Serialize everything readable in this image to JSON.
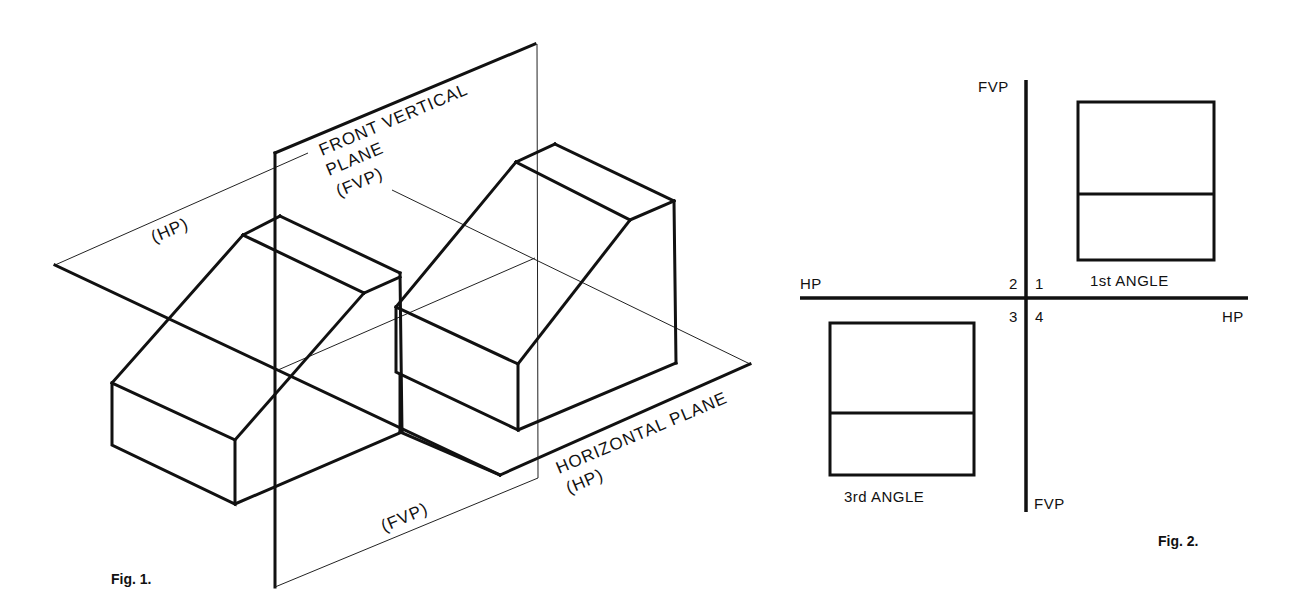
{
  "figure1": {
    "caption": "Fig. 1.",
    "labels": {
      "fvp_line1": "FRONT VERTICAL",
      "fvp_line2": "PLANE",
      "fvp_line3": "(FVP)",
      "hp_upper": "(HP)",
      "fvp_lower": "(FVP)",
      "hp_line1": "HORIZONTAL PLANE",
      "hp_line2": "(HP)"
    }
  },
  "figure2": {
    "caption": "Fig. 2.",
    "axis_labels": {
      "fvp_top": "FVP",
      "fvp_bottom": "FVP",
      "hp_left": "HP",
      "hp_right": "HP"
    },
    "quadrants": {
      "q1": "1",
      "q2": "2",
      "q3": "3",
      "q4": "4"
    },
    "view_labels": {
      "first_angle": "1st ANGLE",
      "third_angle": "3rd ANGLE"
    }
  },
  "colors": {
    "ink": "#111111",
    "paper": "#ffffff"
  }
}
